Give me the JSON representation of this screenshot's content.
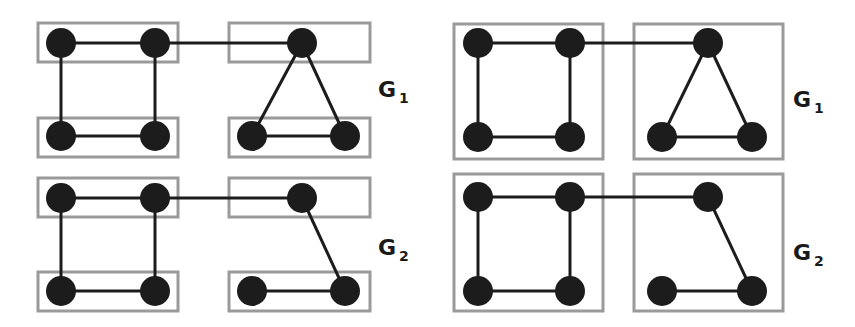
{
  "colors": {
    "node": "#1c1c1c",
    "edge": "#1c1c1c",
    "box": "#9a9a9a",
    "background": "#ffffff"
  },
  "style": {
    "node_radius": 15,
    "edge_width": 3,
    "box_width": 3
  },
  "panels": [
    {
      "name": "left-top",
      "graph_label": "G",
      "graph_subscript": "1",
      "label_pos": [
        378,
        97
      ],
      "boxes": [
        [
          38,
          23,
          140,
          39
        ],
        [
          229,
          23,
          141,
          39
        ],
        [
          38,
          118,
          140,
          39
        ],
        [
          229,
          118,
          141,
          39
        ]
      ],
      "nodes": [
        [
          61,
          43
        ],
        [
          155,
          43
        ],
        [
          302,
          43
        ],
        [
          61,
          136
        ],
        [
          155,
          136
        ],
        [
          252,
          136
        ],
        [
          345,
          136
        ]
      ],
      "edges": [
        [
          0,
          1
        ],
        [
          1,
          2
        ],
        [
          0,
          3
        ],
        [
          1,
          4
        ],
        [
          3,
          4
        ],
        [
          2,
          5
        ],
        [
          2,
          6
        ],
        [
          5,
          6
        ]
      ]
    },
    {
      "name": "left-bottom",
      "graph_label": "G",
      "graph_subscript": "2",
      "label_pos": [
        378,
        255
      ],
      "boxes": [
        [
          38,
          178,
          140,
          39
        ],
        [
          229,
          178,
          141,
          39
        ],
        [
          38,
          272,
          140,
          39
        ],
        [
          229,
          272,
          141,
          39
        ]
      ],
      "nodes": [
        [
          61,
          198
        ],
        [
          155,
          198
        ],
        [
          302,
          198
        ],
        [
          61,
          291
        ],
        [
          155,
          291
        ],
        [
          252,
          291
        ],
        [
          345,
          291
        ]
      ],
      "edges": [
        [
          0,
          1
        ],
        [
          1,
          2
        ],
        [
          0,
          3
        ],
        [
          1,
          4
        ],
        [
          3,
          4
        ],
        [
          2,
          6
        ],
        [
          5,
          6
        ]
      ]
    },
    {
      "name": "right-top",
      "graph_label": "G",
      "graph_subscript": "1",
      "label_pos": [
        793,
        107
      ],
      "boxes": [
        [
          454,
          24,
          149,
          135
        ],
        [
          634,
          24,
          149,
          135
        ]
      ],
      "nodes": [
        [
          478,
          43
        ],
        [
          570,
          43
        ],
        [
          708,
          43
        ],
        [
          478,
          137
        ],
        [
          570,
          137
        ],
        [
          662,
          137
        ],
        [
          752,
          137
        ]
      ],
      "edges": [
        [
          0,
          1
        ],
        [
          1,
          2
        ],
        [
          0,
          3
        ],
        [
          1,
          4
        ],
        [
          3,
          4
        ],
        [
          2,
          5
        ],
        [
          2,
          6
        ],
        [
          5,
          6
        ]
      ]
    },
    {
      "name": "right-bottom",
      "graph_label": "G",
      "graph_subscript": "2",
      "label_pos": [
        793,
        260
      ],
      "boxes": [
        [
          454,
          174,
          149,
          137
        ],
        [
          634,
          174,
          149,
          137
        ]
      ],
      "nodes": [
        [
          478,
          197
        ],
        [
          570,
          197
        ],
        [
          708,
          197
        ],
        [
          478,
          291
        ],
        [
          570,
          291
        ],
        [
          662,
          291
        ],
        [
          752,
          291
        ]
      ],
      "edges": [
        [
          0,
          1
        ],
        [
          1,
          2
        ],
        [
          0,
          3
        ],
        [
          1,
          4
        ],
        [
          3,
          4
        ],
        [
          2,
          6
        ],
        [
          5,
          6
        ]
      ]
    }
  ]
}
